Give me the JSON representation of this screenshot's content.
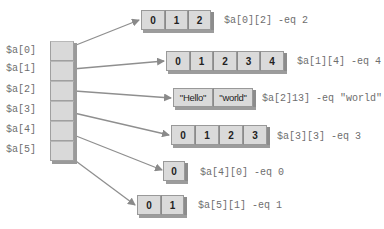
{
  "diagram": {
    "type": "jagged-array",
    "outer_labels": [
      "$a[0]",
      "$a[1]",
      "$a[2]",
      "$a[3]",
      "$a[4]",
      "$a[5]"
    ],
    "inner_arrays": [
      {
        "cells": [
          "0",
          "1",
          "2"
        ],
        "expression": "$a[0][2] -eq 2"
      },
      {
        "cells": [
          "0",
          "1",
          "2",
          "3",
          "4"
        ],
        "expression": "$a[1][4] -eq 4"
      },
      {
        "cells": [
          "\"Hello\"",
          "\"world\""
        ],
        "expression": "$a[2]13] -eq \"world\""
      },
      {
        "cells": [
          "0",
          "1",
          "2",
          "3"
        ],
        "expression": "$a[3][3] -eq 3"
      },
      {
        "cells": [
          "0"
        ],
        "expression": "$a[4][0] -eq 0"
      },
      {
        "cells": [
          "0",
          "1"
        ],
        "expression": "$a[5][1] -eq 1"
      }
    ],
    "colors": {
      "cell_fill": "#dadada",
      "cell_border": "#999999",
      "shadow": "#8c8c8c",
      "arrow": "#8a8a8a",
      "label_text": "#6e6e6e"
    }
  }
}
